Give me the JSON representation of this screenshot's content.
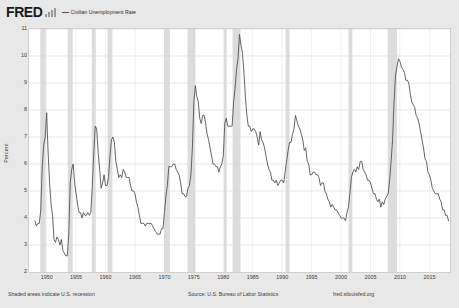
{
  "header": {
    "logo_text": "FRED",
    "logo_icon": "bar-chart-icon",
    "series_label": "Civilian Unemployment Rate"
  },
  "footer": {
    "recession_note": "Shaded areas indicate U.S. recession",
    "source": "Source: U.S. Bureau of Labor Statistics",
    "url": "fred.stlouisfed.org"
  },
  "colors": {
    "page_background": "#e8e8e8",
    "plot_background": "#ffffff",
    "line": "#4a4a4a",
    "grid": "#d8d8d8",
    "recession_band": "#dcdcdc",
    "border": "#cfcfcf",
    "text": "#3d3d3d",
    "logo": "#1a1a1a"
  },
  "chart_data": {
    "type": "line",
    "title": "Civilian Unemployment Rate",
    "xlabel": "",
    "ylabel": "Percent",
    "xlim": [
      1947.0,
      2018.5
    ],
    "ylim": [
      2,
      11
    ],
    "grid": true,
    "legend_position": "top-left",
    "xticks": [
      1950,
      1955,
      1960,
      1965,
      1970,
      1975,
      1980,
      1985,
      1990,
      1995,
      2000,
      2005,
      2010,
      2015
    ],
    "yticks": [
      2,
      3,
      4,
      5,
      6,
      7,
      8,
      9,
      10,
      11
    ],
    "recessions": [
      {
        "start": 1948.92,
        "end": 1949.83
      },
      {
        "start": 1953.58,
        "end": 1954.42
      },
      {
        "start": 1957.67,
        "end": 1958.33
      },
      {
        "start": 1960.33,
        "end": 1961.17
      },
      {
        "start": 1969.92,
        "end": 1970.92
      },
      {
        "start": 1973.92,
        "end": 1975.25
      },
      {
        "start": 1980.08,
        "end": 1980.58
      },
      {
        "start": 1981.58,
        "end": 1982.92
      },
      {
        "start": 1990.58,
        "end": 1991.25
      },
      {
        "start": 2001.25,
        "end": 2001.92
      },
      {
        "start": 2007.92,
        "end": 2009.5
      }
    ],
    "series": [
      {
        "name": "Civilian Unemployment Rate",
        "x": [
          1948.0,
          1948.25,
          1948.5,
          1948.75,
          1949.0,
          1949.25,
          1949.5,
          1949.75,
          1950.0,
          1950.25,
          1950.5,
          1950.75,
          1951.0,
          1951.25,
          1951.5,
          1951.75,
          1952.0,
          1952.25,
          1952.5,
          1952.75,
          1953.0,
          1953.25,
          1953.5,
          1953.75,
          1954.0,
          1954.25,
          1954.5,
          1954.75,
          1955.0,
          1955.25,
          1955.5,
          1955.75,
          1956.0,
          1956.25,
          1956.5,
          1956.75,
          1957.0,
          1957.25,
          1957.5,
          1957.75,
          1958.0,
          1958.25,
          1958.5,
          1958.75,
          1959.0,
          1959.25,
          1959.5,
          1959.75,
          1960.0,
          1960.25,
          1960.5,
          1960.75,
          1961.0,
          1961.25,
          1961.5,
          1961.75,
          1962.0,
          1962.25,
          1962.5,
          1962.75,
          1963.0,
          1963.25,
          1963.5,
          1963.75,
          1964.0,
          1964.25,
          1964.5,
          1964.75,
          1965.0,
          1965.25,
          1965.5,
          1965.75,
          1966.0,
          1966.25,
          1966.5,
          1966.75,
          1967.0,
          1967.25,
          1967.5,
          1967.75,
          1968.0,
          1968.25,
          1968.5,
          1968.75,
          1969.0,
          1969.25,
          1969.5,
          1969.75,
          1970.0,
          1970.25,
          1970.5,
          1970.75,
          1971.0,
          1971.25,
          1971.5,
          1971.75,
          1972.0,
          1972.25,
          1972.5,
          1972.75,
          1973.0,
          1973.25,
          1973.5,
          1973.75,
          1974.0,
          1974.25,
          1974.5,
          1974.75,
          1975.0,
          1975.25,
          1975.5,
          1975.75,
          1976.0,
          1976.25,
          1976.5,
          1976.75,
          1977.0,
          1977.25,
          1977.5,
          1977.75,
          1978.0,
          1978.25,
          1978.5,
          1978.75,
          1979.0,
          1979.25,
          1979.5,
          1979.75,
          1980.0,
          1980.25,
          1980.5,
          1980.75,
          1981.0,
          1981.25,
          1981.5,
          1981.75,
          1982.0,
          1982.25,
          1982.5,
          1982.75,
          1983.0,
          1983.25,
          1983.5,
          1983.75,
          1984.0,
          1984.25,
          1984.5,
          1984.75,
          1985.0,
          1985.25,
          1985.5,
          1985.75,
          1986.0,
          1986.25,
          1986.5,
          1986.75,
          1987.0,
          1987.25,
          1987.5,
          1987.75,
          1988.0,
          1988.25,
          1988.5,
          1988.75,
          1989.0,
          1989.25,
          1989.5,
          1989.75,
          1990.0,
          1990.25,
          1990.5,
          1990.75,
          1991.0,
          1991.25,
          1991.5,
          1991.75,
          1992.0,
          1992.25,
          1992.5,
          1992.75,
          1993.0,
          1993.25,
          1993.5,
          1993.75,
          1994.0,
          1994.25,
          1994.5,
          1994.75,
          1995.0,
          1995.25,
          1995.5,
          1995.75,
          1996.0,
          1996.25,
          1996.5,
          1996.75,
          1997.0,
          1997.25,
          1997.5,
          1997.75,
          1998.0,
          1998.25,
          1998.5,
          1998.75,
          1999.0,
          1999.25,
          1999.5,
          1999.75,
          2000.0,
          2000.25,
          2000.5,
          2000.75,
          2001.0,
          2001.25,
          2001.5,
          2001.75,
          2002.0,
          2002.25,
          2002.5,
          2002.75,
          2003.0,
          2003.25,
          2003.5,
          2003.75,
          2004.0,
          2004.25,
          2004.5,
          2004.75,
          2005.0,
          2005.25,
          2005.5,
          2005.75,
          2006.0,
          2006.25,
          2006.5,
          2006.75,
          2007.0,
          2007.25,
          2007.5,
          2007.75,
          2008.0,
          2008.25,
          2008.5,
          2008.75,
          2009.0,
          2009.25,
          2009.5,
          2009.75,
          2010.0,
          2010.25,
          2010.5,
          2010.75,
          2011.0,
          2011.25,
          2011.5,
          2011.75,
          2012.0,
          2012.25,
          2012.5,
          2012.75,
          2013.0,
          2013.25,
          2013.5,
          2013.75,
          2014.0,
          2014.25,
          2014.5,
          2014.75,
          2015.0,
          2015.25,
          2015.5,
          2015.75,
          2016.0,
          2016.25,
          2016.5,
          2016.75,
          2017.0,
          2017.25,
          2017.5,
          2017.75,
          2018.0,
          2018.25
        ],
        "values": [
          3.9,
          3.7,
          3.8,
          3.8,
          4.3,
          5.9,
          6.7,
          7.0,
          7.9,
          6.4,
          5.3,
          4.5,
          4.1,
          3.2,
          3.1,
          3.3,
          3.2,
          3.0,
          3.2,
          2.8,
          2.7,
          2.6,
          2.6,
          3.4,
          5.3,
          5.8,
          6.0,
          5.3,
          4.9,
          4.5,
          4.2,
          4.2,
          4.0,
          4.2,
          4.1,
          4.1,
          4.2,
          4.1,
          4.2,
          5.2,
          6.4,
          7.4,
          7.3,
          6.4,
          5.8,
          5.1,
          5.3,
          5.6,
          5.2,
          5.2,
          5.5,
          6.3,
          6.9,
          7.0,
          6.8,
          6.1,
          5.8,
          5.5,
          5.6,
          5.5,
          5.8,
          5.7,
          5.5,
          5.5,
          5.5,
          5.2,
          5.0,
          5.0,
          4.9,
          4.6,
          4.4,
          4.1,
          3.8,
          3.8,
          3.8,
          3.7,
          3.8,
          3.8,
          3.8,
          3.8,
          3.7,
          3.6,
          3.5,
          3.4,
          3.4,
          3.4,
          3.6,
          3.6,
          4.2,
          4.8,
          5.2,
          5.9,
          5.9,
          5.9,
          6.0,
          6.0,
          5.8,
          5.7,
          5.6,
          5.3,
          4.9,
          4.9,
          4.8,
          4.8,
          5.1,
          5.2,
          5.6,
          6.6,
          8.3,
          8.9,
          8.5,
          8.3,
          7.7,
          7.5,
          7.8,
          7.8,
          7.5,
          7.1,
          6.9,
          6.6,
          6.3,
          6.0,
          6.0,
          5.9,
          5.9,
          5.7,
          5.9,
          6.0,
          6.3,
          7.5,
          7.7,
          7.4,
          7.4,
          7.4,
          7.4,
          8.3,
          8.8,
          9.5,
          9.9,
          10.8,
          10.4,
          10.1,
          9.4,
          8.5,
          7.8,
          7.4,
          7.4,
          7.2,
          7.3,
          7.3,
          7.2,
          7.0,
          6.7,
          7.2,
          6.9,
          6.8,
          6.6,
          6.3,
          6.0,
          5.8,
          5.7,
          5.4,
          5.4,
          5.3,
          5.4,
          5.2,
          5.3,
          5.4,
          5.4,
          5.3,
          5.7,
          6.1,
          6.5,
          6.8,
          6.8,
          7.1,
          7.3,
          7.8,
          7.6,
          7.4,
          7.3,
          7.1,
          6.9,
          6.5,
          6.6,
          6.1,
          6.0,
          5.6,
          5.6,
          5.7,
          5.7,
          5.6,
          5.6,
          5.5,
          5.2,
          5.3,
          5.3,
          5.0,
          4.9,
          4.7,
          4.6,
          4.4,
          4.5,
          4.4,
          4.3,
          4.3,
          4.2,
          4.1,
          4.0,
          4.0,
          4.0,
          3.9,
          4.2,
          4.4,
          4.9,
          5.5,
          5.7,
          5.8,
          5.7,
          5.9,
          5.8,
          6.1,
          6.1,
          5.8,
          5.7,
          5.6,
          5.4,
          5.4,
          5.3,
          5.1,
          4.9,
          4.9,
          4.7,
          4.6,
          4.7,
          4.4,
          4.6,
          4.5,
          4.7,
          4.8,
          4.9,
          5.4,
          6.1,
          6.9,
          8.3,
          9.3,
          9.6,
          9.9,
          9.8,
          9.6,
          9.5,
          9.4,
          9.1,
          9.1,
          9.0,
          8.6,
          8.3,
          8.2,
          8.1,
          7.8,
          7.7,
          7.5,
          7.2,
          6.9,
          6.6,
          6.2,
          6.1,
          5.7,
          5.6,
          5.4,
          5.1,
          5.0,
          4.9,
          4.9,
          4.9,
          4.7,
          4.6,
          4.3,
          4.3,
          4.1,
          4.1,
          3.9
        ]
      }
    ]
  }
}
